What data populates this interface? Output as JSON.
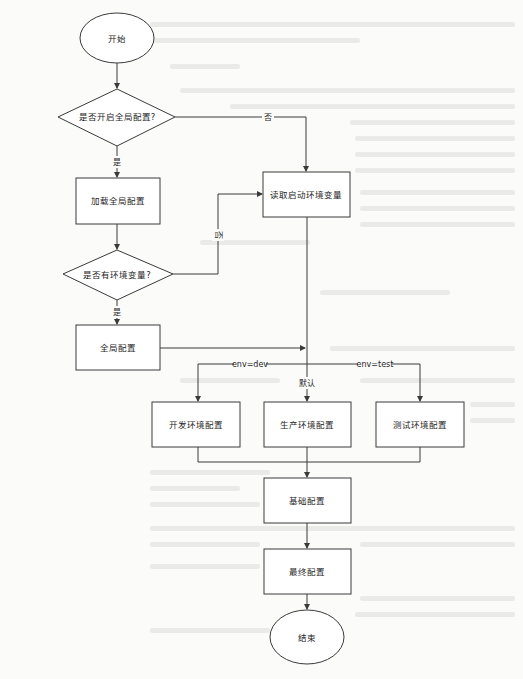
{
  "diagram": {
    "type": "flowchart",
    "nodes": {
      "start": {
        "label": "开始",
        "shape": "ellipse"
      },
      "decision_global": {
        "label": "是否开启全局配置?",
        "shape": "diamond"
      },
      "load_global": {
        "label": "加载全局配置",
        "shape": "rect"
      },
      "read_env": {
        "label": "读取启动环境变量",
        "shape": "rect"
      },
      "decision_env": {
        "label": "是否有环境变量?",
        "shape": "diamond"
      },
      "global_config": {
        "label": "全局配置",
        "shape": "rect"
      },
      "dev_config": {
        "label": "开发环境配置",
        "shape": "rect"
      },
      "prod_config": {
        "label": "生产环境配置",
        "shape": "rect"
      },
      "test_config": {
        "label": "测试环境配置",
        "shape": "rect"
      },
      "base_config": {
        "label": "基础配置",
        "shape": "rect"
      },
      "final_config": {
        "label": "最终配置",
        "shape": "rect"
      },
      "end": {
        "label": "结束",
        "shape": "ellipse"
      }
    },
    "edge_labels": {
      "global_no": "否",
      "global_yes": "是",
      "env_no": "否",
      "env_yes": "是",
      "env_dev": "env=dev",
      "env_default": "默认",
      "env_test": "env=test"
    },
    "edges": [
      {
        "from": "start",
        "to": "decision_global"
      },
      {
        "from": "decision_global",
        "to": "load_global",
        "label": "是"
      },
      {
        "from": "decision_global",
        "to": "read_env",
        "label": "否"
      },
      {
        "from": "load_global",
        "to": "decision_env"
      },
      {
        "from": "decision_env",
        "to": "read_env",
        "label": "否"
      },
      {
        "from": "decision_env",
        "to": "global_config",
        "label": "是"
      },
      {
        "from": "global_config",
        "to": "env_switch"
      },
      {
        "from": "read_env",
        "to": "dev_config",
        "label": "env=dev"
      },
      {
        "from": "read_env",
        "to": "prod_config",
        "label": "默认"
      },
      {
        "from": "read_env",
        "to": "test_config",
        "label": "env=test"
      },
      {
        "from": "dev_config",
        "to": "base_config"
      },
      {
        "from": "prod_config",
        "to": "base_config"
      },
      {
        "from": "test_config",
        "to": "base_config"
      },
      {
        "from": "base_config",
        "to": "final_config"
      },
      {
        "from": "final_config",
        "to": "end"
      }
    ],
    "colors": {
      "stroke": "#3a3a3a",
      "fill": "#ffffff",
      "background": "#fbfbfa"
    }
  }
}
